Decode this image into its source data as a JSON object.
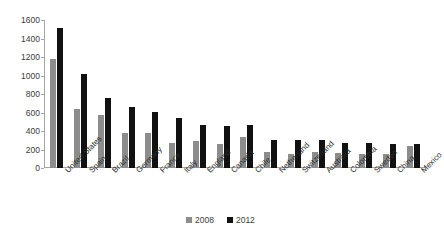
{
  "chart_data": {
    "type": "bar",
    "title": "",
    "subtitle": "",
    "xlabel": "",
    "ylabel": "",
    "ylim": [
      0,
      1600
    ],
    "ytick_step": 200,
    "yticks": [
      0,
      200,
      400,
      600,
      800,
      1000,
      1200,
      1400,
      1600
    ],
    "ytick_labels": [
      "0",
      "200",
      "400",
      "600",
      "800",
      "1000",
      "1200",
      "1400",
      "1600"
    ],
    "grid": false,
    "legend_position": "bottom-center",
    "orientation": "vertical",
    "categories": [
      "United States",
      "Spain",
      "Brazil",
      "Germany",
      "France",
      "Italy",
      "England",
      "Canada",
      "Chile",
      "Netherland",
      "Switzerland",
      "Australia",
      "Colombia",
      "Sweden",
      "China",
      "Mexico"
    ],
    "series": [
      {
        "name": "2008",
        "color": "#8c8c8c",
        "values": [
          1175,
          640,
          575,
          375,
          380,
          275,
          290,
          255,
          330,
          175,
          150,
          175,
          160,
          155,
          150,
          235
        ]
      },
      {
        "name": "2012",
        "color": "#111111",
        "values": [
          1510,
          1020,
          755,
          665,
          610,
          545,
          460,
          450,
          460,
          305,
          300,
          305,
          275,
          275,
          260,
          260
        ]
      }
    ]
  },
  "legend": {
    "items": [
      {
        "label": "2008",
        "color": "#8c8c8c"
      },
      {
        "label": "2012",
        "color": "#111111"
      }
    ]
  },
  "colors": {
    "series_2008": "#8c8c8c",
    "series_2012": "#111111",
    "axis": "#a6a6a6",
    "text": "#2b2b2b",
    "background": "#ffffff"
  }
}
